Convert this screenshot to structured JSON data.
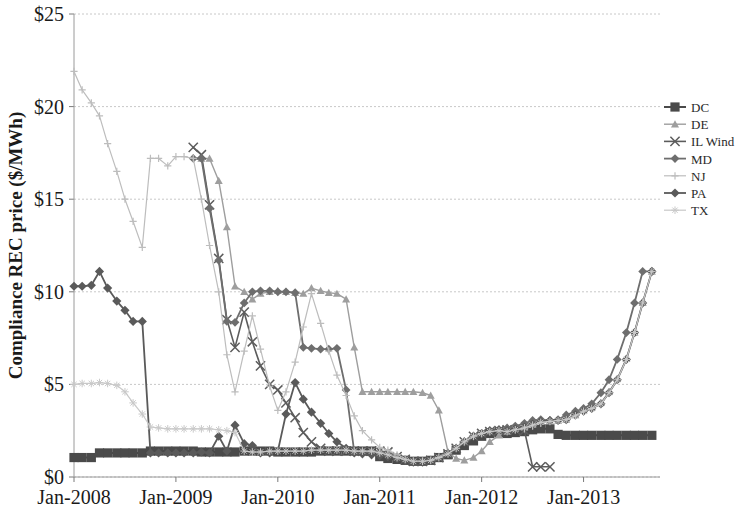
{
  "chart_data": {
    "type": "line",
    "title": "",
    "xlabel": "",
    "ylabel": "Compliance REC price ($/MWh)",
    "ylim": [
      0,
      25
    ],
    "ytick_values": [
      0,
      5,
      10,
      15,
      20,
      25
    ],
    "ytick_labels": [
      "$0",
      "$5",
      "$10",
      "$15",
      "$20",
      "$25"
    ],
    "xlim": [
      2008.0,
      2013.75
    ],
    "xtick_values": [
      2008,
      2009,
      2010,
      2011,
      2012,
      2013
    ],
    "xtick_labels": [
      "Jan-2008",
      "Jan-2009",
      "Jan-2010",
      "Jan-2011",
      "Jan-2012",
      "Jan-2013"
    ],
    "grid": true,
    "grid_axis": "y",
    "legend_position": "right",
    "series": [
      {
        "name": "DC",
        "color": "#4a4a4a",
        "marker": "square",
        "marker_size": 4.6,
        "line_width": 2.0,
        "x": [
          2008.0,
          2008.08,
          2008.17,
          2008.25,
          2008.33,
          2008.42,
          2008.5,
          2008.58,
          2008.67,
          2008.75,
          2008.83,
          2008.92,
          2009.0,
          2009.08,
          2009.17,
          2009.25,
          2009.33,
          2009.42,
          2009.5,
          2009.58,
          2009.67,
          2009.75,
          2009.83,
          2009.92,
          2010.0,
          2010.08,
          2010.17,
          2010.25,
          2010.33,
          2010.42,
          2010.5,
          2010.58,
          2010.67,
          2010.75,
          2010.83,
          2010.92,
          2011.0,
          2011.08,
          2011.17,
          2011.25,
          2011.33,
          2011.42,
          2011.5,
          2011.58,
          2011.67,
          2011.75,
          2011.83,
          2011.92,
          2012.0,
          2012.08,
          2012.17,
          2012.25,
          2012.33,
          2012.42,
          2012.5,
          2012.58,
          2012.67,
          2012.75,
          2012.83,
          2012.92,
          2013.0,
          2013.08,
          2013.17,
          2013.25,
          2013.33,
          2013.42,
          2013.5,
          2013.58,
          2013.67
        ],
        "values": [
          1.05,
          1.05,
          1.05,
          1.3,
          1.3,
          1.3,
          1.3,
          1.3,
          1.3,
          1.4,
          1.4,
          1.4,
          1.4,
          1.4,
          1.4,
          1.35,
          1.35,
          1.35,
          1.35,
          1.35,
          1.4,
          1.4,
          1.4,
          1.4,
          1.35,
          1.35,
          1.35,
          1.35,
          1.35,
          1.4,
          1.4,
          1.4,
          1.4,
          1.4,
          1.4,
          1.4,
          1.1,
          1.0,
          0.95,
          0.9,
          0.85,
          0.85,
          0.9,
          1.05,
          1.2,
          1.45,
          1.7,
          1.95,
          2.2,
          2.35,
          2.4,
          2.35,
          2.4,
          2.45,
          2.55,
          2.6,
          2.6,
          2.3,
          2.25,
          2.25,
          2.25,
          2.25,
          2.25,
          2.25,
          2.25,
          2.25,
          2.25,
          2.25,
          2.25
        ]
      },
      {
        "name": "DE",
        "color": "#9e9e9e",
        "marker": "triangle",
        "marker_size": 4.0,
        "line_width": 1.4,
        "x": [
          2009.25,
          2009.33,
          2009.42,
          2009.5,
          2009.58,
          2009.67,
          2009.75,
          2009.83,
          2009.92,
          2010.0,
          2010.08,
          2010.17,
          2010.25,
          2010.33,
          2010.42,
          2010.5,
          2010.58,
          2010.67,
          2010.75,
          2010.83,
          2010.92,
          2011.0,
          2011.08,
          2011.17,
          2011.25,
          2011.33,
          2011.42,
          2011.5,
          2011.58,
          2011.67,
          2011.75,
          2011.83,
          2011.92,
          2012.0,
          2012.08,
          2012.17,
          2012.25,
          2012.33,
          2012.42,
          2012.5,
          2012.58,
          2012.67,
          2012.75,
          2012.83,
          2012.92,
          2013.0,
          2013.08,
          2013.17,
          2013.25,
          2013.33,
          2013.42,
          2013.5,
          2013.58,
          2013.67
        ],
        "values": [
          17.2,
          17.2,
          16.0,
          13.5,
          10.3,
          10.0,
          9.6,
          9.9,
          10.0,
          10.05,
          10.0,
          9.95,
          9.9,
          10.2,
          10.05,
          9.95,
          9.9,
          9.6,
          7.0,
          4.6,
          4.6,
          4.6,
          4.6,
          4.6,
          4.6,
          4.6,
          4.55,
          4.4,
          3.6,
          1.35,
          1.0,
          0.9,
          1.05,
          1.4,
          1.9,
          2.25,
          2.45,
          2.6,
          2.7,
          2.85,
          3.0,
          3.05,
          3.05,
          3.1,
          3.35,
          3.6,
          3.75,
          4.0,
          4.6,
          5.3,
          6.4,
          7.8,
          9.4,
          11.1
        ]
      },
      {
        "name": "IL Wind",
        "color": "#5c5c5c",
        "marker": "x",
        "marker_size": 4.6,
        "line_width": 1.6,
        "x": [
          2009.17,
          2009.25,
          2009.33,
          2009.42,
          2009.5,
          2009.58,
          2009.67,
          2009.75,
          2009.83,
          2009.92,
          2010.0,
          2010.08,
          2010.17,
          2010.25,
          2010.33,
          2010.42,
          2010.5,
          2010.58,
          2010.67,
          2010.75,
          2010.83,
          2010.92,
          2011.0,
          2011.08,
          2011.17,
          2011.25,
          2011.33,
          2011.42,
          2011.5,
          2011.58,
          2011.67,
          2011.75,
          2011.83,
          2011.92,
          2012.0,
          2012.08,
          2012.17,
          2012.25,
          2012.33,
          2012.42,
          2012.5,
          2012.58,
          2012.67
        ],
        "values": [
          17.8,
          17.4,
          14.7,
          11.8,
          8.5,
          7.0,
          8.9,
          7.3,
          6.0,
          5.0,
          4.7,
          4.0,
          3.2,
          2.4,
          1.9,
          1.55,
          1.4,
          1.4,
          1.4,
          1.4,
          1.4,
          1.4,
          1.4,
          1.35,
          1.1,
          0.95,
          0.85,
          0.85,
          0.9,
          1.05,
          1.25,
          1.55,
          1.9,
          2.2,
          2.35,
          2.45,
          2.5,
          2.55,
          2.55,
          2.5,
          0.55,
          0.55,
          0.55
        ]
      },
      {
        "name": "MD",
        "color": "#6e6e6e",
        "marker": "diamond",
        "marker_size": 4.4,
        "line_width": 1.8,
        "x": [
          2009.17,
          2009.25,
          2009.33,
          2009.42,
          2009.5,
          2009.58,
          2009.67,
          2009.75,
          2009.83,
          2009.92,
          2010.0,
          2010.08,
          2010.17,
          2010.25,
          2010.33,
          2010.42,
          2010.5,
          2010.58,
          2010.67,
          2010.75,
          2010.83,
          2010.92,
          2011.0,
          2011.08,
          2011.17,
          2011.25,
          2011.33,
          2011.42,
          2011.5,
          2011.58,
          2011.67,
          2011.75,
          2011.83,
          2011.92,
          2012.0,
          2012.08,
          2012.17,
          2012.25,
          2012.33,
          2012.42,
          2012.5,
          2012.58,
          2012.67,
          2012.75,
          2012.83,
          2012.92,
          2013.0,
          2013.08,
          2013.17,
          2013.25,
          2013.33,
          2013.42,
          2013.5,
          2013.58,
          2013.67
        ],
        "values": [
          17.2,
          17.2,
          14.5,
          11.7,
          8.4,
          8.35,
          9.4,
          10.0,
          10.05,
          10.05,
          10.0,
          10.0,
          9.95,
          7.0,
          6.95,
          6.9,
          6.9,
          6.95,
          4.7,
          1.35,
          1.35,
          1.35,
          1.35,
          1.3,
          1.1,
          0.95,
          0.85,
          0.85,
          0.9,
          1.05,
          1.25,
          1.55,
          1.9,
          2.2,
          2.35,
          2.45,
          2.55,
          2.65,
          2.75,
          2.9,
          3.05,
          3.1,
          3.05,
          3.1,
          3.35,
          3.55,
          3.7,
          3.95,
          4.55,
          5.25,
          6.35,
          7.8,
          9.4,
          11.1,
          11.1
        ]
      },
      {
        "name": "NJ",
        "color": "#bdbdbd",
        "marker": "plus",
        "marker_size": 3.6,
        "line_width": 1.2,
        "x": [
          2008.0,
          2008.08,
          2008.17,
          2008.25,
          2008.33,
          2008.42,
          2008.5,
          2008.58,
          2008.67,
          2008.75,
          2008.83,
          2008.92,
          2009.0,
          2009.08,
          2009.17,
          2009.25,
          2009.33,
          2009.42,
          2009.5,
          2009.58,
          2009.67,
          2009.75,
          2009.83,
          2009.92,
          2010.0,
          2010.08,
          2010.17,
          2010.25,
          2010.33,
          2010.42,
          2010.5,
          2010.58,
          2010.67,
          2010.75,
          2010.83,
          2010.92,
          2011.0,
          2011.08,
          2011.17,
          2011.25,
          2011.33,
          2011.42,
          2011.5,
          2011.58,
          2011.67,
          2011.75,
          2011.83,
          2011.92,
          2012.0,
          2012.08,
          2012.17,
          2012.25,
          2012.33,
          2012.42,
          2012.5,
          2012.58,
          2012.67,
          2012.75,
          2012.83,
          2012.92,
          2013.0,
          2013.08,
          2013.17,
          2013.25,
          2013.33,
          2013.42,
          2013.5,
          2013.58,
          2013.67
        ],
        "values": [
          21.9,
          20.9,
          20.2,
          19.5,
          18.0,
          16.5,
          15.0,
          13.8,
          12.4,
          17.2,
          17.2,
          16.8,
          17.3,
          17.3,
          17.2,
          15.0,
          12.5,
          10.0,
          6.6,
          4.6,
          6.8,
          8.7,
          6.9,
          4.9,
          3.6,
          4.6,
          6.2,
          8.1,
          9.9,
          8.3,
          6.8,
          5.5,
          4.4,
          3.3,
          2.5,
          2.0,
          1.6,
          1.45,
          1.2,
          1.0,
          0.85,
          0.85,
          0.95,
          1.1,
          1.3,
          1.6,
          1.95,
          2.25,
          2.4,
          2.5,
          2.55,
          2.5,
          2.55,
          2.6,
          2.75,
          2.9,
          3.0,
          3.05,
          3.1,
          3.3,
          3.55,
          3.7,
          3.95,
          4.55,
          5.25,
          6.35,
          7.8,
          9.4,
          11.1
        ]
      },
      {
        "name": "PA",
        "color": "#5a5a5a",
        "marker": "diamond",
        "marker_size": 4.6,
        "line_width": 1.8,
        "x": [
          2008.0,
          2008.08,
          2008.17,
          2008.25,
          2008.33,
          2008.42,
          2008.5,
          2008.58,
          2008.67,
          2008.75,
          2008.83,
          2008.92,
          2009.0,
          2009.08,
          2009.17,
          2009.25,
          2009.33,
          2009.42,
          2009.5,
          2009.58,
          2009.67,
          2009.75,
          2009.83,
          2009.92,
          2010.0,
          2010.08,
          2010.17,
          2010.25,
          2010.33,
          2010.42,
          2010.5,
          2010.58,
          2010.67,
          2010.75,
          2010.83,
          2010.92,
          2011.0,
          2011.08,
          2011.17,
          2011.25,
          2011.33,
          2011.42,
          2011.5,
          2011.58,
          2011.67,
          2011.75,
          2011.83,
          2011.92,
          2012.0,
          2012.08,
          2012.17,
          2012.25,
          2012.33,
          2012.42,
          2012.5,
          2012.58,
          2012.67,
          2012.75,
          2012.83,
          2012.92,
          2013.0,
          2013.08,
          2013.17,
          2013.25,
          2013.33,
          2013.42,
          2013.5,
          2013.58,
          2013.67
        ],
        "values": [
          10.3,
          10.3,
          10.35,
          11.1,
          10.2,
          9.5,
          9.0,
          8.4,
          8.4,
          1.3,
          1.3,
          1.3,
          1.3,
          1.3,
          1.3,
          1.35,
          1.3,
          2.2,
          1.4,
          2.8,
          1.8,
          1.7,
          1.3,
          1.3,
          1.4,
          3.4,
          5.1,
          4.2,
          3.5,
          2.9,
          2.35,
          1.9,
          1.55,
          1.3,
          1.25,
          1.2,
          1.15,
          1.1,
          1.0,
          0.9,
          0.8,
          0.8,
          0.9,
          1.05,
          1.25,
          1.55,
          1.9,
          2.2,
          2.35,
          2.5,
          2.55,
          2.5,
          2.6,
          2.7,
          2.85,
          3.0,
          3.05,
          3.05,
          3.1,
          3.35,
          3.55,
          3.7,
          3.95,
          4.55,
          5.25,
          6.35,
          7.8,
          9.4,
          11.1
        ]
      },
      {
        "name": "TX",
        "color": "#c9c9c9",
        "marker": "star",
        "marker_size": 3.8,
        "line_width": 1.2,
        "x": [
          2008.0,
          2008.08,
          2008.17,
          2008.25,
          2008.33,
          2008.42,
          2008.5,
          2008.58,
          2008.67,
          2008.75,
          2008.83,
          2008.92,
          2009.0,
          2009.08,
          2009.17,
          2009.25,
          2009.33,
          2009.42,
          2009.5,
          2009.58,
          2009.67,
          2009.75,
          2009.83,
          2009.92,
          2010.0,
          2010.08,
          2010.17,
          2010.25,
          2010.33,
          2010.42,
          2010.5,
          2010.58,
          2010.67,
          2010.75,
          2010.83,
          2010.92,
          2011.0,
          2011.08,
          2011.17,
          2011.25,
          2011.33,
          2011.42,
          2011.5,
          2011.58,
          2011.67,
          2011.75,
          2011.83,
          2011.92,
          2012.0,
          2012.08,
          2012.17,
          2012.25,
          2012.33,
          2012.42,
          2012.5,
          2012.58,
          2012.67,
          2012.75,
          2012.83,
          2012.92,
          2013.0,
          2013.08,
          2013.17,
          2013.25,
          2013.33,
          2013.42,
          2013.5,
          2013.58,
          2013.67
        ],
        "values": [
          5.0,
          5.05,
          5.05,
          5.1,
          5.05,
          4.95,
          4.6,
          4.0,
          3.4,
          2.7,
          2.65,
          2.6,
          2.6,
          2.6,
          2.6,
          2.6,
          2.6,
          2.55,
          2.5,
          2.4,
          1.4,
          1.35,
          1.35,
          1.4,
          1.4,
          1.4,
          1.4,
          1.4,
          1.45,
          1.45,
          1.45,
          1.45,
          1.45,
          1.4,
          1.4,
          1.4,
          1.3,
          1.2,
          1.05,
          0.95,
          0.85,
          0.85,
          0.9,
          1.05,
          1.25,
          1.55,
          1.9,
          2.2,
          2.35,
          2.45,
          2.5,
          2.45,
          2.55,
          2.65,
          2.8,
          2.95,
          3.0,
          3.05,
          3.1,
          3.3,
          3.55,
          3.7,
          3.95,
          4.55,
          5.25,
          6.35,
          7.8,
          9.4,
          11.1
        ]
      }
    ]
  },
  "legend": {
    "items": [
      {
        "label": "DC"
      },
      {
        "label": "DE"
      },
      {
        "label": "IL Wind"
      },
      {
        "label": "MD"
      },
      {
        "label": "NJ"
      },
      {
        "label": "PA"
      },
      {
        "label": "TX"
      }
    ]
  },
  "colors": {
    "grid": "#c8c8c8",
    "axis": "#9a9a9a",
    "text": "#1a1a1a"
  }
}
